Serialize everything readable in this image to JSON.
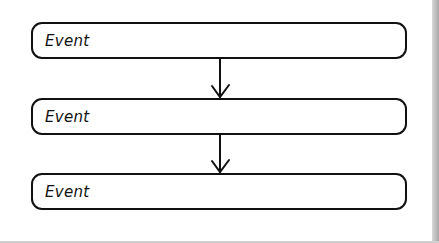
{
  "diagram": {
    "type": "flowchart",
    "nodes": [
      {
        "id": 1,
        "label": "Event"
      },
      {
        "id": 2,
        "label": "Event"
      },
      {
        "id": 3,
        "label": "Event"
      }
    ],
    "edges": [
      {
        "from": 1,
        "to": 2
      },
      {
        "from": 2,
        "to": 3
      }
    ]
  }
}
